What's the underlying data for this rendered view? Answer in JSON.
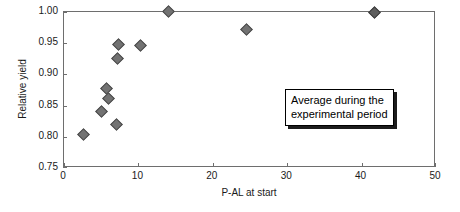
{
  "chart_data": {
    "type": "scatter",
    "title": "",
    "xlabel": "P-AL at start",
    "ylabel": "Relative yield",
    "xlim": [
      0,
      50
    ],
    "ylim": [
      0.75,
      1.0
    ],
    "xticks": [
      0,
      10,
      20,
      30,
      40,
      50
    ],
    "yticks": [
      0.75,
      0.8,
      0.85,
      0.9,
      0.95,
      1.0
    ],
    "xticklabels": [
      "0",
      "10",
      "20",
      "30",
      "40",
      "50"
    ],
    "yticklabels": [
      "0.75",
      "0.80",
      "0.85",
      "0.90",
      "0.95",
      "1.00"
    ],
    "grid": false,
    "legend": null,
    "marker": "diamond",
    "marker_color": "#727272",
    "marker_edge_color": "#4a4a4a",
    "points": [
      {
        "x": 2.6,
        "y": 0.801,
        "emphasis": false
      },
      {
        "x": 5.0,
        "y": 0.839,
        "emphasis": false
      },
      {
        "x": 5.8,
        "y": 0.876,
        "emphasis": false
      },
      {
        "x": 6.0,
        "y": 0.86,
        "emphasis": false
      },
      {
        "x": 7.1,
        "y": 0.817,
        "emphasis": false
      },
      {
        "x": 7.2,
        "y": 0.925,
        "emphasis": false
      },
      {
        "x": 7.4,
        "y": 0.947,
        "emphasis": false
      },
      {
        "x": 10.3,
        "y": 0.945,
        "emphasis": false
      },
      {
        "x": 14.1,
        "y": 1.001,
        "emphasis": false
      },
      {
        "x": 24.7,
        "y": 0.972,
        "emphasis": false
      },
      {
        "x": 42.0,
        "y": 0.999,
        "emphasis": true
      }
    ],
    "annotations": [
      {
        "name": "average-period-callout",
        "lines": [
          "Average during the",
          "experimental period"
        ],
        "x": 24.5,
        "y": 0.905
      }
    ]
  }
}
